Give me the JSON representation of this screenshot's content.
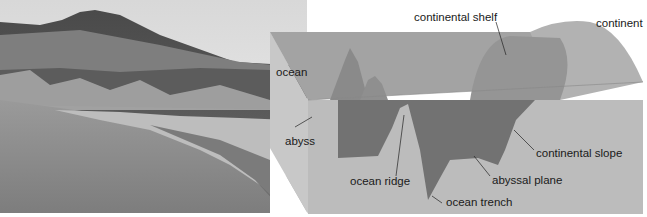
{
  "photo": {
    "description": "grayscale coastal landscape photograph with hill, cliffs and pebble beach"
  },
  "diagram": {
    "labels": {
      "continental_shelf": "continental shelf",
      "continent": "continent",
      "ocean": "ocean",
      "abyss": "abyss",
      "ocean_ridge": "ocean ridge",
      "ocean_trench": "ocean trench",
      "abyssal_plane": "abyssal plane",
      "continental_slope": "continental slope"
    },
    "colors": {
      "block_front": "#b9b9b9",
      "block_side": "#c9c9c9",
      "water_surface": "#9e9e9e",
      "seafloor": "#7a7a7a",
      "continent": "#a8a8a8"
    }
  }
}
